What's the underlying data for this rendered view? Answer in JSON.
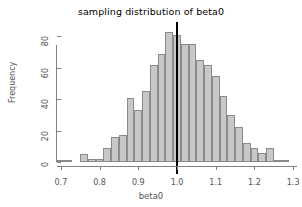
{
  "chart_data": {
    "type": "bar",
    "subtype": "histogram",
    "title": "sampling distribution of beta0",
    "xlabel": "beta0",
    "ylabel": "Frequency",
    "xlim": [
      0.69,
      1.31
    ],
    "ylim": [
      0,
      84
    ],
    "xticks": [
      0.7,
      0.8,
      0.9,
      1.0,
      1.1,
      1.2,
      1.3
    ],
    "xtick_labels": [
      "0.7",
      "0.8",
      "0.9",
      "1.0",
      "1.1",
      "1.2",
      "1.3"
    ],
    "yticks": [
      0,
      20,
      40,
      60,
      80
    ],
    "ytick_labels": [
      "0",
      "20",
      "40",
      "60",
      "80"
    ],
    "grid": false,
    "legend": false,
    "bin_width": 0.02,
    "bin_starts": [
      0.69,
      0.71,
      0.73,
      0.75,
      0.77,
      0.79,
      0.81,
      0.83,
      0.85,
      0.87,
      0.89,
      0.91,
      0.93,
      0.95,
      0.97,
      0.99,
      1.01,
      1.03,
      1.05,
      1.07,
      1.09,
      1.11,
      1.13,
      1.15,
      1.17,
      1.19,
      1.21,
      1.23,
      1.25,
      1.27
    ],
    "categories": [
      "0.69-0.71",
      "0.71-0.73",
      "0.73-0.75",
      "0.75-0.77",
      "0.77-0.79",
      "0.79-0.81",
      "0.81-0.83",
      "0.83-0.85",
      "0.85-0.87",
      "0.87-0.89",
      "0.89-0.91",
      "0.91-0.93",
      "0.93-0.95",
      "0.95-0.97",
      "0.97-0.99",
      "0.99-1.01",
      "1.01-1.03",
      "1.03-1.05",
      "1.05-1.07",
      "1.07-1.09",
      "1.09-1.11",
      "1.11-1.13",
      "1.13-1.15",
      "1.15-1.17",
      "1.17-1.19",
      "1.19-1.21",
      "1.21-1.23",
      "1.23-1.25",
      "1.25-1.27",
      "1.27-1.29"
    ],
    "values": [
      1,
      1,
      0,
      5,
      2,
      2,
      9,
      16,
      17,
      41,
      33,
      45,
      62,
      69,
      83,
      81,
      75,
      75,
      65,
      62,
      55,
      42,
      30,
      22,
      12,
      9,
      6,
      9,
      1,
      1
    ],
    "bar_fill_color": "#c8c8c8",
    "bar_edge_color": "#8a8a8a",
    "reference_line": {
      "x": 1.0,
      "color": "#000000",
      "width": 2,
      "label": "true value"
    }
  }
}
